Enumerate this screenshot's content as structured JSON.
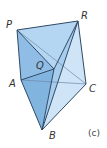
{
  "diagram": {
    "caption": "(c)",
    "labels": {
      "P": "P",
      "Q": "Q",
      "R": "R",
      "A": "A",
      "B": "B",
      "C": "C"
    },
    "colors": {
      "edge": "#2f4a66",
      "face_dark": "#8fbde6",
      "face_mid": "#b4d6f2",
      "face_light": "#d9ecfa",
      "background": "#ffffff"
    }
  }
}
